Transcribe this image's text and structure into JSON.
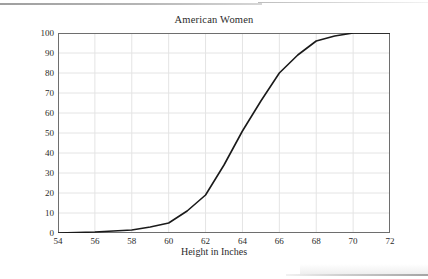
{
  "chart_data": {
    "type": "line",
    "title": "American Women",
    "xlabel": "Height in Inches",
    "ylabel": "Percentage of Women Who Are Shorter",
    "xlim": [
      54,
      72
    ],
    "ylim": [
      0,
      100
    ],
    "xticks": [
      54,
      56,
      58,
      60,
      62,
      64,
      66,
      68,
      70,
      72
    ],
    "yticks": [
      0,
      10,
      20,
      30,
      40,
      50,
      60,
      70,
      80,
      90,
      100
    ],
    "grid": true,
    "legend": null,
    "legend_position": "none",
    "series": [
      {
        "name": "Cumulative percentage of American women shorter than height",
        "x": [
          54,
          56,
          58,
          59,
          60,
          61,
          62,
          63,
          64,
          65,
          66,
          67,
          68,
          69,
          70,
          71,
          72
        ],
        "values": [
          0,
          0.5,
          1.5,
          3,
          5,
          11,
          19,
          34,
          51,
          66,
          80,
          89,
          96,
          98.5,
          100,
          100,
          100
        ]
      }
    ],
    "line_color": "#1a1a1a",
    "grid_color": "#e4e4e4",
    "axis_color": "#6e6e6e"
  },
  "axes": {
    "x_tick_labels": [
      "54",
      "56",
      "58",
      "60",
      "62",
      "64",
      "66",
      "68",
      "70",
      "72"
    ],
    "y_tick_labels": [
      "0",
      "10",
      "20",
      "30",
      "40",
      "50",
      "60",
      "70",
      "80",
      "90",
      "100"
    ]
  }
}
